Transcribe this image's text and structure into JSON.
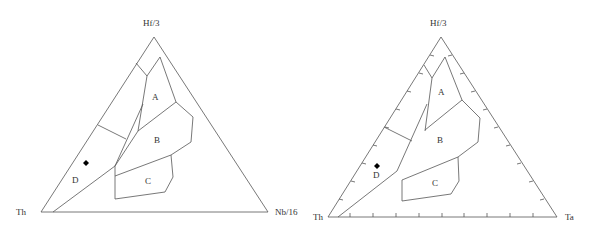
{
  "diagrams": [
    {
      "name": "Hf/3 - Th - Nb/16 ternary",
      "apex_labels": {
        "top": "Hf/3",
        "left": "Th",
        "right": "Nb/16"
      },
      "region_labels": {
        "a": "A",
        "b": "B",
        "c": "C",
        "d": "D"
      },
      "sample_marker": "◆"
    },
    {
      "name": "Hf/3 - Th - Ta ternary",
      "apex_labels": {
        "top": "Hf/3",
        "left": "Th",
        "right": "Ta"
      },
      "region_labels": {
        "a": "A",
        "b": "B",
        "c": "C",
        "d": "D"
      },
      "sample_marker": "◆"
    }
  ],
  "colors": {
    "line": "#555555",
    "text": "#333333",
    "marker": "#000000"
  }
}
